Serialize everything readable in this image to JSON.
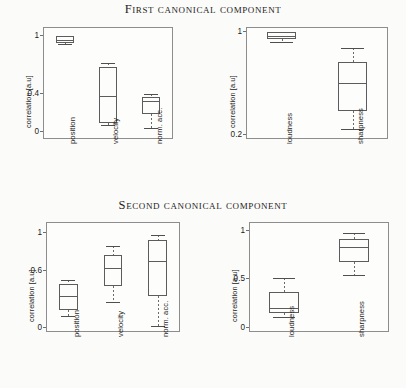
{
  "figure": {
    "titles": {
      "first": "First canonical component",
      "second": "Second canonical component"
    },
    "axis_label": "correlation [a.u]"
  },
  "chart_data": [
    {
      "id": "first-kinematic",
      "type": "box",
      "title": "First canonical component",
      "subplot": "top-left",
      "xlabel": "",
      "ylabel": "correlation [a.u]",
      "categories": [
        "position",
        "velocity",
        "norm. acc."
      ],
      "yticks": [
        0,
        0.4,
        1
      ],
      "ylim": [
        -0.08,
        1.08
      ],
      "grid": false,
      "boxes": [
        {
          "category": "position",
          "whisker_low": 0.9,
          "q1": 0.915,
          "median": 0.95,
          "q3": 0.985,
          "whisker_high": 0.99
        },
        {
          "category": "velocity",
          "whisker_low": 0.07,
          "q1": 0.085,
          "median": 0.365,
          "q3": 0.665,
          "whisker_high": 0.705
        },
        {
          "category": "norm. acc.",
          "whisker_low": 0.035,
          "q1": 0.175,
          "median": 0.31,
          "q3": 0.355,
          "whisker_high": 0.385
        }
      ]
    },
    {
      "id": "first-psychoacoustic",
      "type": "box",
      "title": "First canonical component",
      "subplot": "top-right",
      "xlabel": "",
      "ylabel": "correlation [a.u]",
      "yticks": [
        0.2,
        1
      ],
      "ylim": [
        0.185,
        1.06
      ],
      "yscale": "log",
      "grid": false,
      "categories": [
        "loudness",
        "sharpness"
      ],
      "boxes": [
        {
          "category": "loudness",
          "whisker_low": 0.845,
          "q1": 0.88,
          "median": 0.915,
          "q3": 0.975,
          "whisker_high": 0.985
        },
        {
          "category": "sharpness",
          "whisker_low": 0.215,
          "q1": 0.285,
          "median": 0.44,
          "q3": 0.615,
          "whisker_high": 0.76
        }
      ]
    },
    {
      "id": "second-kinematic",
      "type": "box",
      "title": "Second canonical component",
      "subplot": "bottom-left",
      "xlabel": "",
      "ylabel": "correlation [a.u]",
      "yticks": [
        0,
        0.6,
        1
      ],
      "ylim": [
        -0.05,
        1.1
      ],
      "grid": false,
      "categories": [
        "position",
        "velocity",
        "norm. acc."
      ],
      "boxes": [
        {
          "category": "position",
          "whisker_low": 0.115,
          "q1": 0.175,
          "median": 0.325,
          "q3": 0.455,
          "whisker_high": 0.49
        },
        {
          "category": "velocity",
          "whisker_low": 0.265,
          "q1": 0.435,
          "median": 0.615,
          "q3": 0.76,
          "whisker_high": 0.85
        },
        {
          "category": "norm. acc.",
          "whisker_low": 0.01,
          "q1": 0.325,
          "median": 0.695,
          "q3": 0.915,
          "whisker_high": 0.965
        }
      ]
    },
    {
      "id": "second-psychoacoustic",
      "type": "box",
      "title": "Second canonical component",
      "subplot": "bottom-right",
      "xlabel": "",
      "ylabel": "correlation [a.u]",
      "yticks": [
        0,
        0.5,
        1
      ],
      "ylim": [
        -0.05,
        1.08
      ],
      "grid": false,
      "categories": [
        "loudness",
        "sharpness"
      ],
      "boxes": [
        {
          "category": "loudness",
          "whisker_low": 0.105,
          "q1": 0.145,
          "median": 0.195,
          "q3": 0.36,
          "whisker_high": 0.5
        },
        {
          "category": "sharpness",
          "whisker_low": 0.535,
          "q1": 0.665,
          "median": 0.82,
          "q3": 0.905,
          "whisker_high": 0.965
        }
      ]
    }
  ]
}
